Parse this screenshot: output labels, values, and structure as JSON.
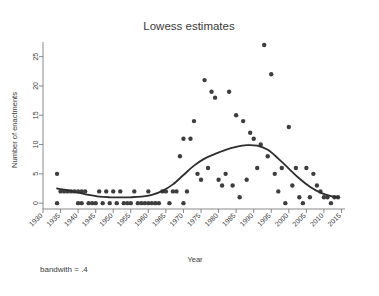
{
  "figure": {
    "title": "Lowess estimates",
    "note": "bandwith = .4",
    "watermark_top": "",
    "watermark_bottom": ""
  },
  "chart_data": {
    "type": "scatter",
    "title": "Lowess estimates",
    "xlabel": "Year",
    "ylabel": "Number of enactments",
    "note": "bandwith = .4",
    "xlim": [
      1930,
      2016
    ],
    "ylim": [
      -1,
      27.5
    ],
    "xticks": [
      1930,
      1935,
      1940,
      1945,
      1950,
      1955,
      1960,
      1965,
      1970,
      1975,
      1980,
      1985,
      1990,
      1995,
      2000,
      2005,
      2010,
      2015
    ],
    "xtick_labels": [
      "1930",
      "1935",
      "1940",
      "1945",
      "1950",
      "1955",
      "1960",
      "1965",
      "1970",
      "1975",
      "1980",
      "1985",
      "1990",
      "1995",
      "2000",
      "2005",
      "2010",
      "2015"
    ],
    "yticks": [
      0,
      5,
      10,
      15,
      20,
      25
    ],
    "ytick_labels": [
      "0",
      "5",
      "10",
      "15",
      "20",
      "25"
    ],
    "grid": false,
    "legend": false,
    "marker": "filled-circle",
    "marker_color": "#3e3e3e",
    "line_color": "#2e2e2e",
    "series": [
      {
        "name": "Number of enactments",
        "type": "scatter",
        "points": [
          [
            1934,
            5
          ],
          [
            1934,
            0
          ],
          [
            1935,
            2
          ],
          [
            1936,
            2
          ],
          [
            1937,
            2
          ],
          [
            1938,
            2
          ],
          [
            1939,
            2
          ],
          [
            1940,
            2
          ],
          [
            1940,
            0
          ],
          [
            1941,
            2
          ],
          [
            1941,
            0
          ],
          [
            1942,
            2
          ],
          [
            1943,
            0
          ],
          [
            1944,
            0
          ],
          [
            1945,
            0
          ],
          [
            1946,
            2
          ],
          [
            1947,
            0
          ],
          [
            1948,
            2
          ],
          [
            1949,
            0
          ],
          [
            1950,
            2
          ],
          [
            1951,
            0
          ],
          [
            1952,
            2
          ],
          [
            1953,
            0
          ],
          [
            1954,
            0
          ],
          [
            1955,
            0
          ],
          [
            1956,
            2
          ],
          [
            1957,
            0
          ],
          [
            1958,
            0
          ],
          [
            1959,
            0
          ],
          [
            1960,
            2
          ],
          [
            1960,
            0
          ],
          [
            1961,
            0
          ],
          [
            1962,
            0
          ],
          [
            1963,
            0
          ],
          [
            1964,
            2
          ],
          [
            1965,
            2
          ],
          [
            1966,
            0
          ],
          [
            1967,
            2
          ],
          [
            1968,
            2
          ],
          [
            1969,
            8
          ],
          [
            1970,
            11
          ],
          [
            1970,
            0
          ],
          [
            1971,
            2
          ],
          [
            1972,
            11
          ],
          [
            1973,
            14
          ],
          [
            1974,
            5
          ],
          [
            1975,
            4
          ],
          [
            1976,
            21
          ],
          [
            1977,
            6
          ],
          [
            1978,
            19
          ],
          [
            1979,
            18
          ],
          [
            1980,
            4
          ],
          [
            1981,
            3
          ],
          [
            1982,
            5
          ],
          [
            1983,
            19
          ],
          [
            1984,
            3
          ],
          [
            1985,
            15
          ],
          [
            1986,
            1
          ],
          [
            1987,
            14
          ],
          [
            1988,
            4
          ],
          [
            1989,
            12
          ],
          [
            1990,
            11
          ],
          [
            1991,
            6
          ],
          [
            1992,
            10
          ],
          [
            1993,
            27
          ],
          [
            1994,
            8
          ],
          [
            1995,
            22
          ],
          [
            1996,
            5
          ],
          [
            1997,
            2
          ],
          [
            1998,
            6
          ],
          [
            1999,
            0
          ],
          [
            2000,
            13
          ],
          [
            2001,
            3
          ],
          [
            2002,
            6
          ],
          [
            2003,
            1
          ],
          [
            2004,
            0
          ],
          [
            2005,
            6
          ],
          [
            2006,
            1
          ],
          [
            2007,
            5
          ],
          [
            2008,
            3
          ],
          [
            2009,
            2
          ],
          [
            2010,
            1
          ],
          [
            2011,
            1
          ],
          [
            2012,
            0
          ],
          [
            2013,
            1
          ],
          [
            2014,
            1
          ]
        ]
      },
      {
        "name": "lowess smooth",
        "type": "line",
        "points": [
          [
            1934,
            2.5
          ],
          [
            1937,
            2.2
          ],
          [
            1940,
            1.8
          ],
          [
            1943,
            1.4
          ],
          [
            1946,
            1.1
          ],
          [
            1949,
            1.0
          ],
          [
            1952,
            1.0
          ],
          [
            1955,
            1.0
          ],
          [
            1958,
            1.1
          ],
          [
            1961,
            1.4
          ],
          [
            1964,
            2.1
          ],
          [
            1967,
            3.2
          ],
          [
            1970,
            4.8
          ],
          [
            1973,
            6.4
          ],
          [
            1976,
            7.6
          ],
          [
            1979,
            8.4
          ],
          [
            1982,
            9.1
          ],
          [
            1985,
            9.6
          ],
          [
            1988,
            9.9
          ],
          [
            1991,
            9.8
          ],
          [
            1994,
            9.1
          ],
          [
            1997,
            7.6
          ],
          [
            2000,
            5.9
          ],
          [
            2003,
            4.2
          ],
          [
            2006,
            2.8
          ],
          [
            2009,
            1.8
          ],
          [
            2012,
            1.2
          ],
          [
            2014,
            1.0
          ]
        ]
      }
    ]
  }
}
